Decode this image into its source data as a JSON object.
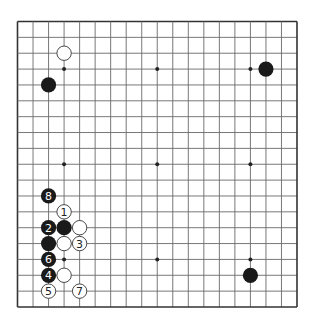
{
  "diagram": {
    "type": "go-board",
    "size": 19,
    "colors": {
      "background": "#ffffff",
      "grid": "#6a6a6a",
      "border": "#333333",
      "black_stone": "#1a1a1a",
      "white_stone": "#ffffff",
      "white_stroke": "#333333"
    },
    "star_points": [
      [
        3,
        3
      ],
      [
        9,
        3
      ],
      [
        15,
        3
      ],
      [
        3,
        9
      ],
      [
        9,
        9
      ],
      [
        15,
        9
      ],
      [
        3,
        15
      ],
      [
        9,
        15
      ],
      [
        15,
        15
      ]
    ],
    "stones": [
      {
        "col": 3,
        "row": 2,
        "color": "white",
        "label": ""
      },
      {
        "col": 2,
        "row": 4,
        "color": "black",
        "label": ""
      },
      {
        "col": 16,
        "row": 3,
        "color": "black",
        "label": ""
      },
      {
        "col": 15,
        "row": 16,
        "color": "black",
        "label": ""
      },
      {
        "col": 2,
        "row": 11,
        "color": "black",
        "label": "8"
      },
      {
        "col": 3,
        "row": 12,
        "color": "white",
        "label": "1"
      },
      {
        "col": 2,
        "row": 13,
        "color": "black",
        "label": "2"
      },
      {
        "col": 3,
        "row": 13,
        "color": "black",
        "label": ""
      },
      {
        "col": 4,
        "row": 13,
        "color": "white",
        "label": ""
      },
      {
        "col": 2,
        "row": 14,
        "color": "black",
        "label": ""
      },
      {
        "col": 3,
        "row": 14,
        "color": "white",
        "label": ""
      },
      {
        "col": 4,
        "row": 14,
        "color": "white",
        "label": "3"
      },
      {
        "col": 2,
        "row": 15,
        "color": "black",
        "label": "6"
      },
      {
        "col": 2,
        "row": 16,
        "color": "black",
        "label": "4"
      },
      {
        "col": 3,
        "row": 16,
        "color": "white",
        "label": ""
      },
      {
        "col": 2,
        "row": 17,
        "color": "white",
        "label": "5"
      },
      {
        "col": 4,
        "row": 17,
        "color": "white",
        "label": "7"
      }
    ]
  }
}
